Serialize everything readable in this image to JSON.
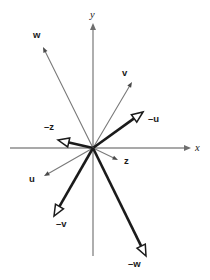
{
  "figure": {
    "background_color": "#ffffff",
    "width": 210,
    "height": 280,
    "origin": {
      "x": 93,
      "y": 148
    }
  },
  "colors": {
    "axis": "#8c8c8c",
    "thin_vector": "#7a7a7a",
    "thick_vector": "#1b1b1b",
    "hollow_fill": "#ffffff",
    "text": "#1a1a1a"
  },
  "axes": {
    "x": {
      "label": "x",
      "label_pos": {
        "x": 195,
        "y": 151
      },
      "start": {
        "x": 10,
        "y": 148
      },
      "end": {
        "x": 187,
        "y": 148
      },
      "arrow": "right"
    },
    "y": {
      "label": "y",
      "label_pos": {
        "x": 90,
        "y": 18
      },
      "start": {
        "x": 93,
        "y": 256
      },
      "end": {
        "x": 93,
        "y": 27
      },
      "arrow": "up"
    }
  },
  "vectors": [
    {
      "id": "w",
      "label": "w",
      "style": "thin",
      "head": "solid-small",
      "tip": {
        "x": 43,
        "y": 47
      },
      "label_pos": {
        "x": 33,
        "y": 38
      },
      "angle_deg": 115.7,
      "length": 112
    },
    {
      "id": "v",
      "label": "v",
      "style": "thin",
      "head": "solid-small",
      "tip": {
        "x": 132,
        "y": 82
      },
      "label_pos": {
        "x": 122,
        "y": 76
      },
      "angle_deg": 59.4,
      "length": 77
    },
    {
      "id": "minus-u",
      "label": "–u",
      "style": "thick",
      "head": "hollow-triangle",
      "tip": {
        "x": 143,
        "y": 112
      },
      "label_pos": {
        "x": 148,
        "y": 122
      },
      "angle_deg": 35.7,
      "length": 62
    },
    {
      "id": "minus-z",
      "label": "–z",
      "style": "thick",
      "head": "hollow-triangle",
      "tip": {
        "x": 58,
        "y": 140
      },
      "label_pos": {
        "x": 44,
        "y": 130
      },
      "angle_deg": 167.1,
      "length": 36
    },
    {
      "id": "z",
      "label": "z",
      "style": "thin",
      "head": "solid-small",
      "tip": {
        "x": 118,
        "y": 160
      },
      "label_pos": {
        "x": 124,
        "y": 164
      },
      "angle_deg": -25.6,
      "length": 28
    },
    {
      "id": "u",
      "label": "u",
      "style": "thin",
      "head": "solid-small",
      "tip": {
        "x": 44,
        "y": 176
      },
      "label_pos": {
        "x": 29,
        "y": 182
      },
      "angle_deg": -150.3,
      "length": 56
    },
    {
      "id": "minus-v",
      "label": "–v",
      "style": "thick",
      "head": "hollow-triangle",
      "tip": {
        "x": 54,
        "y": 216
      },
      "label_pos": {
        "x": 56,
        "y": 227
      },
      "angle_deg": -120.6,
      "length": 79
    },
    {
      "id": "minus-w",
      "label": "–w",
      "style": "thick",
      "head": "hollow-triangle",
      "tip": {
        "x": 146,
        "y": 256
      },
      "label_pos": {
        "x": 128,
        "y": 267
      },
      "angle_deg": -64.3,
      "length": 120
    }
  ]
}
